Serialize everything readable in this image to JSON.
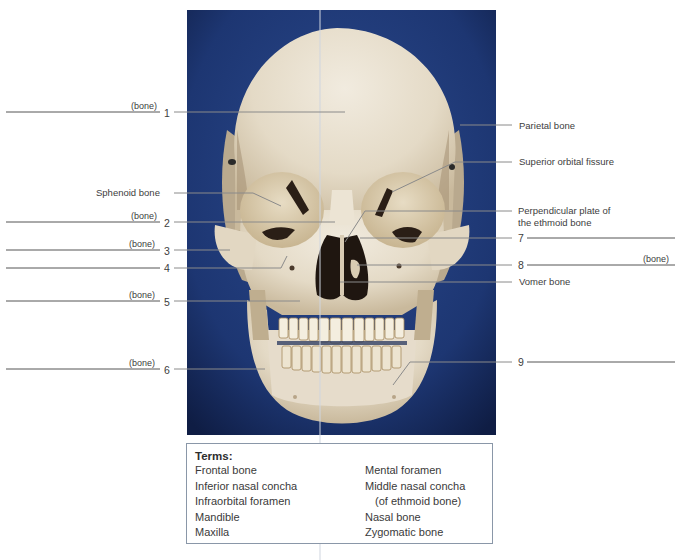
{
  "figure": {
    "background_color": "#1e3a78",
    "bone_color": "#e8e0d0"
  },
  "left_labels": [
    {
      "id": "1",
      "number": "1",
      "blank_suffix": "(bone)",
      "y": 112
    },
    {
      "id": "sphenoid",
      "text": "Sphenoid bone",
      "y": 193
    },
    {
      "id": "2",
      "number": "2",
      "blank_suffix": "(bone)",
      "y": 222
    },
    {
      "id": "3",
      "number": "3",
      "blank_suffix": "(bone)",
      "y": 250
    },
    {
      "id": "4",
      "number": "4",
      "blank_suffix": "",
      "y": 268
    },
    {
      "id": "5",
      "number": "5",
      "blank_suffix": "(bone)",
      "y": 301
    },
    {
      "id": "6",
      "number": "6",
      "blank_suffix": "(bone)",
      "y": 369
    }
  ],
  "right_labels": [
    {
      "id": "parietal",
      "text": "Parietal bone",
      "y": 125
    },
    {
      "id": "sof",
      "text": "Superior orbital fissure",
      "y": 162
    },
    {
      "id": "perp",
      "text": "Perpendicular plate of",
      "text2": "the ethmoid bone",
      "y": 211
    },
    {
      "id": "7",
      "number": "7",
      "blank_suffix": "",
      "y": 238
    },
    {
      "id": "8",
      "number": "8",
      "blank_suffix": "(bone)",
      "y": 265
    },
    {
      "id": "vomer",
      "text": "Vomer bone",
      "y": 282
    },
    {
      "id": "9",
      "number": "9",
      "blank_suffix": "",
      "y": 362
    }
  ],
  "terms": {
    "title": "Terms:",
    "left": [
      "Frontal bone",
      "Inferior nasal concha",
      "Infraorbital foramen",
      "Mandible",
      "Maxilla"
    ],
    "right": [
      "Mental foramen",
      "Middle nasal concha",
      "(of ethmoid bone)",
      "Nasal bone",
      "Zygomatic bone"
    ]
  }
}
